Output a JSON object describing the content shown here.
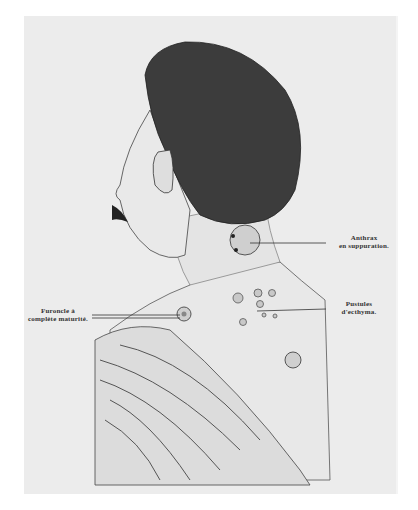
{
  "figure": {
    "labels": {
      "anthrax": [
        "Anthrax",
        "en suppuration."
      ],
      "furoncle": [
        "Furoncle à",
        "complète maturité."
      ],
      "pustules": [
        "Pustules",
        "d'ecthyma."
      ]
    },
    "colors": {
      "background": "#ffffff",
      "plate": "#ececec",
      "ink": "#2a2a2a",
      "hair": "#3a3a3a",
      "skin": "#e6e6e6"
    }
  }
}
